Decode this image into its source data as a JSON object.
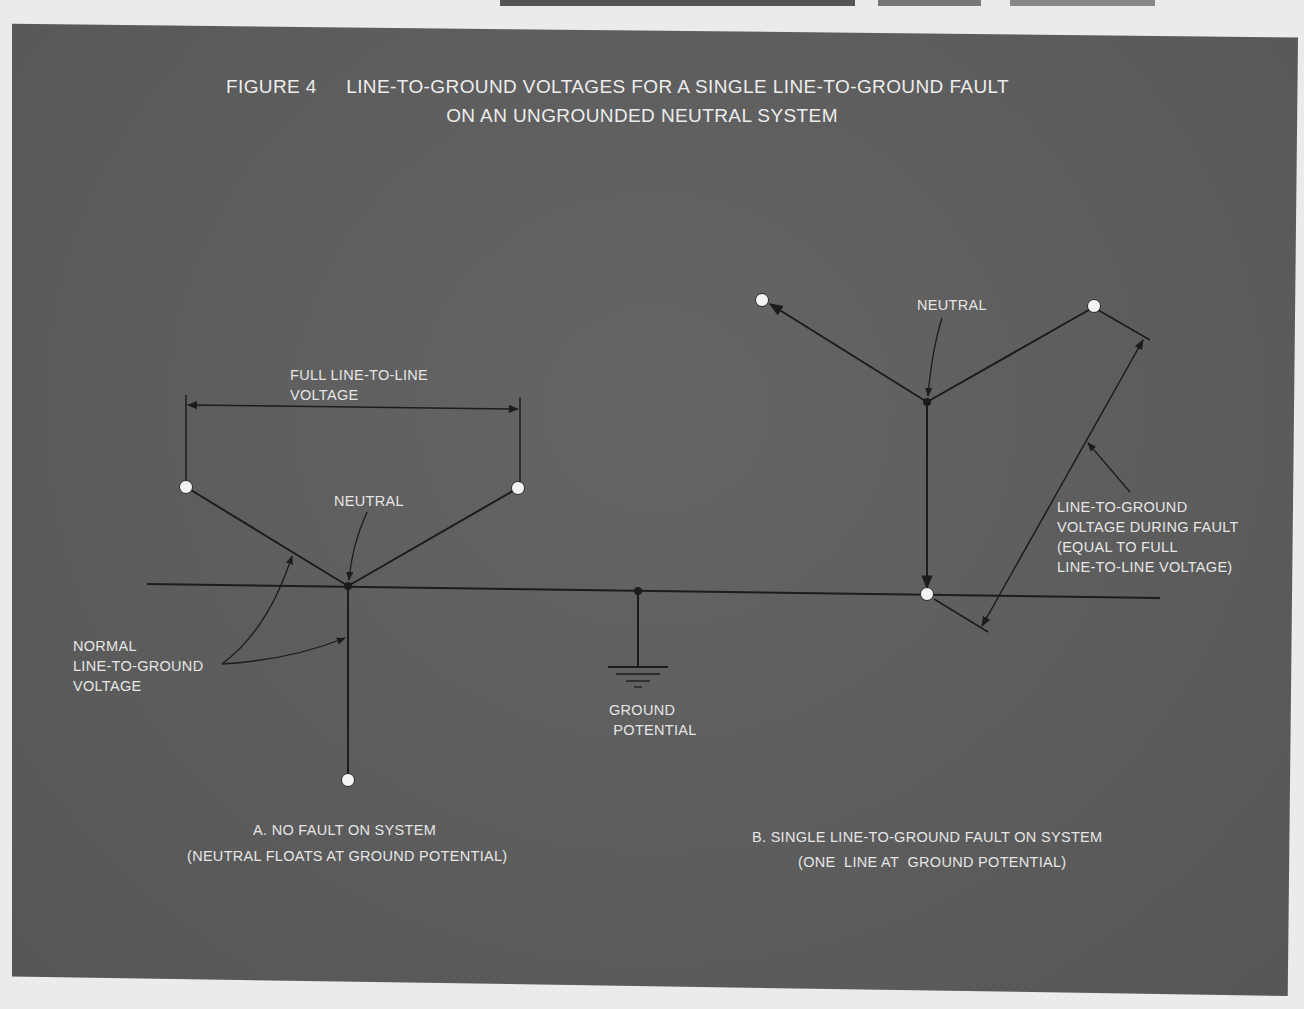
{
  "figure": {
    "number": "FIGURE 4",
    "title_line1": "LINE-TO-GROUND VOLTAGES FOR A SINGLE LINE-TO-GROUND FAULT",
    "title_line2": "ON AN UNGROUNDED NEUTRAL SYSTEM"
  },
  "colors": {
    "panel": "#5d5d5d",
    "page": "#ecebea",
    "lines": "#1c1c1c",
    "text": "#e6e6e6",
    "terminal": "#f4f4f4"
  },
  "diagram_a": {
    "full_voltage_label": "FULL LINE-TO-LINE\nVOLTAGE",
    "neutral_label": "NEUTRAL",
    "normal_voltage_label": "NORMAL\nLINE-TO-GROUND\nVOLTAGE",
    "caption_line1": "A. NO FAULT ON SYSTEM",
    "caption_line2": "(NEUTRAL FLOATS AT GROUND POTENTIAL)"
  },
  "ground": {
    "label": "GROUND\n POTENTIAL",
    "symbol": "ground-symbol"
  },
  "diagram_b": {
    "neutral_label": "NEUTRAL",
    "fault_voltage_label": "LINE-TO-GROUND\nVOLTAGE DURING FAULT\n(EQUAL TO FULL\nLINE-TO-LINE VOLTAGE)",
    "caption_line1": "B. SINGLE LINE-TO-GROUND FAULT ON SYSTEM",
    "caption_line2": "(ONE  LINE AT  GROUND POTENTIAL)"
  }
}
